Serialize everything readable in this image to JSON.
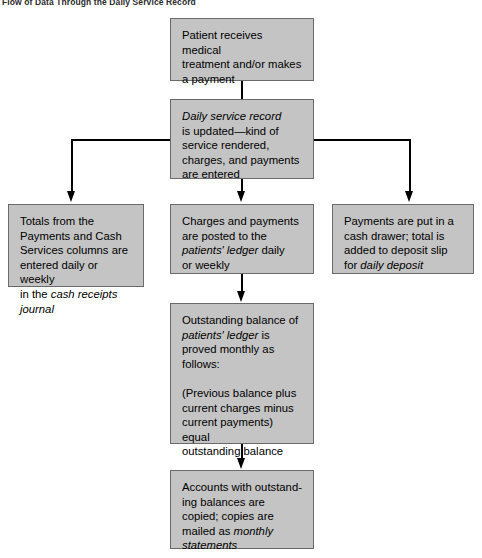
{
  "figure": {
    "caption": "Flow of Data Through the Daily Service Record",
    "colors": {
      "box_fill": "#c4c4c4",
      "box_border": "#6a6a6a",
      "shadow": "#0a0a0a",
      "connector": "#000000",
      "page_background": "#ffffff",
      "text": "#000000"
    }
  },
  "chart_data": {
    "type": "diagram",
    "title": "Flow of Data Through the Daily Service Record",
    "orientation": "top-to-bottom",
    "nodes": [
      {
        "id": "patient",
        "label": "Patient receives medical treatment and/or makes a payment"
      },
      {
        "id": "daily_record",
        "label": "Daily service record is updated—kind of service rendered, charges, and payments are entered"
      },
      {
        "id": "totals",
        "label": "Totals from the Payments and Cash Services columns are entered daily or weekly in the cash receipts journal"
      },
      {
        "id": "charges",
        "label": "Charges and payments are posted to the patients' ledger daily or weekly"
      },
      {
        "id": "cash_drawer",
        "label": "Payments are put in a cash drawer; total is added to deposit slip for daily deposit"
      },
      {
        "id": "outstanding",
        "label": "Outstanding balance of patients' ledger is proved monthly as follows: (Previous balance plus current charges minus current payments) equal outstanding balance"
      },
      {
        "id": "accounts",
        "label": "Accounts with outstanding balances are copied; copies are mailed as monthly statements"
      }
    ],
    "edges": [
      {
        "from": "patient",
        "to": "daily_record"
      },
      {
        "from": "daily_record",
        "to": "totals"
      },
      {
        "from": "daily_record",
        "to": "charges"
      },
      {
        "from": "daily_record",
        "to": "cash_drawer"
      },
      {
        "from": "charges",
        "to": "outstanding"
      },
      {
        "from": "outstanding",
        "to": "accounts"
      }
    ]
  },
  "boxes": {
    "patient": {
      "line1": "Patient receives medical",
      "line2": "treatment and/or makes",
      "line3": "a payment"
    },
    "daily_record": {
      "italic_lead": "Daily service record",
      "line2": "is updated—kind of",
      "line3": "service rendered,",
      "line4": "charges, and payments",
      "line5": "are entered"
    },
    "totals": {
      "line1": "Totals from the",
      "line2": "Payments and Cash",
      "line3": "Services columns are",
      "line4": "entered daily or weekly",
      "line5_plain": "in the ",
      "line5_italic": "cash receipts",
      "line6_italic": "journal"
    },
    "charges": {
      "line1": "Charges and payments",
      "line2": "are posted to the",
      "line3_italic": "patients' ledger",
      "line3_plain": " daily",
      "line4": "or weekly"
    },
    "cash_drawer": {
      "line1": "Payments are put in a",
      "line2": "cash drawer; total is",
      "line3": "added to deposit slip",
      "line4_plain": "for ",
      "line4_italic": "daily deposit"
    },
    "outstanding": {
      "line1": "Outstanding balance of",
      "line2_italic": "patients' ledger",
      "line2_plain": " is",
      "line3": "proved monthly as",
      "line4": "follows:",
      "line5": "(Previous balance plus",
      "line6": "current charges minus",
      "line7": "current payments) equal",
      "line8": "outstanding balance"
    },
    "accounts": {
      "line1": "Accounts with outstand-",
      "line2": "ing balances are",
      "line3": "copied; copies are",
      "line4_plain": "mailed as ",
      "line4_italic": "monthly",
      "line5_italic": "statements"
    }
  }
}
